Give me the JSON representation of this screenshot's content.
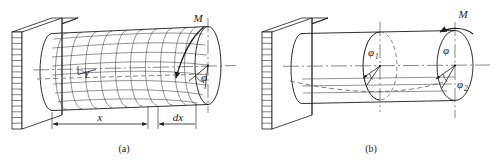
{
  "figure": {
    "kind": "engineering-diagram",
    "background_color": "#ffffff",
    "line_color": "#1a1a1a",
    "axis_color": "#555555",
    "dash_color": "#777777"
  },
  "panel_a": {
    "caption": "(a)",
    "torque_label": "M",
    "shear_strain_label": "γ",
    "twist_angle_label": "φ",
    "dimension_x_label": "x",
    "dimension_dx_label": "dx",
    "wall_hatch_rows": 17,
    "grid_rings": 11,
    "grid_generatrices": 9
  },
  "panel_b": {
    "caption": "(b)",
    "torque_label": "M",
    "angle_mid_label": "φ",
    "angle_mid_sub": "1",
    "angle_end_label": "φ",
    "angle_end_sub2": "2",
    "angle_end_plain_label": "φ",
    "wall_hatch_rows": 17
  }
}
